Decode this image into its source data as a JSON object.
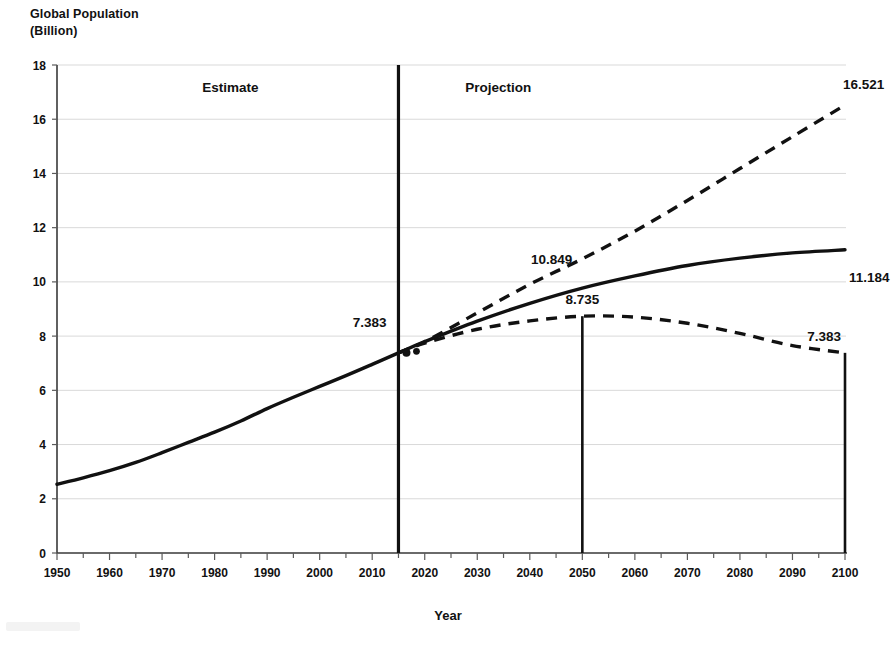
{
  "chart_data": {
    "type": "line",
    "title": "",
    "ylabel": "Global Population\n(Billion)",
    "xlabel": "Year",
    "xlim": [
      1950,
      2100
    ],
    "ylim": [
      0,
      18
    ],
    "xticks": [
      1950,
      1960,
      1970,
      1980,
      1990,
      2000,
      2010,
      2020,
      2030,
      2040,
      2050,
      2060,
      2070,
      2080,
      2090,
      2100
    ],
    "yticks": [
      0,
      2,
      4,
      6,
      8,
      10,
      12,
      14,
      16,
      18
    ],
    "grid": true,
    "legend": "none",
    "region_labels": [
      {
        "text": "Estimate",
        "x": 1983,
        "y": 17.0
      },
      {
        "text": "Projection",
        "x": 2034,
        "y": 17.0
      }
    ],
    "divider": {
      "x": 2015,
      "label": "7.383",
      "value": 7.383
    },
    "series": [
      {
        "name": "Estimate",
        "style": "solid",
        "x": [
          1950,
          1955,
          1960,
          1965,
          1970,
          1975,
          1980,
          1985,
          1990,
          1995,
          2000,
          2005,
          2010,
          2015
        ],
        "values": [
          2.536,
          2.773,
          3.035,
          3.34,
          3.7,
          4.079,
          4.458,
          4.871,
          5.327,
          5.744,
          6.145,
          6.542,
          6.958,
          7.383
        ]
      },
      {
        "name": "High variant",
        "style": "dashed",
        "x": [
          2015,
          2020,
          2030,
          2040,
          2050,
          2060,
          2070,
          2080,
          2090,
          2100
        ],
        "values": [
          7.383,
          7.795,
          8.856,
          9.912,
          10.849,
          11.872,
          13.003,
          14.18,
          15.357,
          16.521
        ],
        "end_label": "16.521",
        "mid_label": {
          "text": "10.849",
          "x": 2050,
          "y": 10.849
        }
      },
      {
        "name": "Medium variant",
        "style": "solid",
        "x": [
          2015,
          2020,
          2030,
          2040,
          2050,
          2060,
          2070,
          2080,
          2090,
          2100
        ],
        "values": [
          7.383,
          7.795,
          8.551,
          9.21,
          9.772,
          10.222,
          10.606,
          10.875,
          11.069,
          11.184
        ],
        "end_label": "11.184"
      },
      {
        "name": "Low variant",
        "style": "dashed",
        "x": [
          2015,
          2020,
          2030,
          2040,
          2050,
          2060,
          2070,
          2080,
          2090,
          2100
        ],
        "values": [
          7.383,
          7.74,
          8.253,
          8.561,
          8.735,
          8.7,
          8.474,
          8.1,
          7.65,
          7.383
        ],
        "end_label": "7.383"
      }
    ],
    "markers": [
      {
        "x": 2050,
        "label": "8.735",
        "value": 8.735,
        "from": 8.735,
        "to": 0
      },
      {
        "x": 2100,
        "label": "7.383",
        "value": 7.383,
        "from": 7.383,
        "to": 0
      }
    ]
  }
}
